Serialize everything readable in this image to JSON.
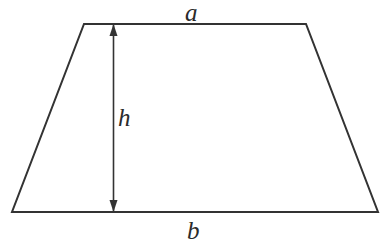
{
  "figure": {
    "kind": "geometry-diagram",
    "shape_name": "trapezoid",
    "background_color": "#ffffff",
    "stroke_color": "#333333",
    "stroke_width": 2,
    "arrow_color": "#333333",
    "label_color": "#2b2b2b",
    "labels": {
      "top_side": "a",
      "height": "h",
      "bottom_side": "b"
    },
    "geometry": {
      "canvas": {
        "width": 386,
        "height": 244
      },
      "vertices": {
        "top_left": [
          84,
          24
        ],
        "top_right": [
          306,
          24
        ],
        "bottom_right": [
          378,
          212
        ],
        "bottom_left": [
          12,
          212
        ]
      },
      "height_arrow": {
        "x": 113,
        "y_top": 24,
        "y_bottom": 212,
        "head_width": 8,
        "head_length": 12,
        "double_headed": true
      }
    }
  }
}
